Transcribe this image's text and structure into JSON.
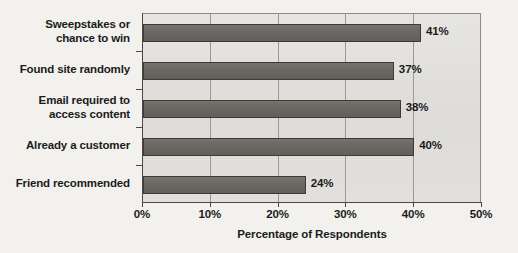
{
  "chart_data": {
    "type": "bar",
    "orientation": "horizontal",
    "title": "",
    "xlabel": "Percentage of Respondents",
    "ylabel": "",
    "xlim": [
      0,
      50
    ],
    "xticks": [
      "0%",
      "10%",
      "20%",
      "30%",
      "40%",
      "50%"
    ],
    "grid": true,
    "legend": false,
    "categories": [
      "Sweepstakes or chance to win",
      "Found site randomly",
      "Email required to access content",
      "Already a customer",
      "Friend recommended"
    ],
    "values": [
      41,
      37,
      38,
      40,
      24
    ],
    "value_labels": [
      "41%",
      "37%",
      "38%",
      "40%",
      "24%"
    ],
    "colors": {
      "bar_fill": "#6a6863",
      "bar_border": "#3b3a37",
      "plot_background": "#e2e0dd",
      "page_background": "#f2f1ee",
      "gridline": "#9c9a96",
      "text": "#1b1b1b"
    }
  },
  "axis": {
    "x_title": "Percentage of Respondents",
    "ticks": [
      {
        "label": "0%",
        "value": 0
      },
      {
        "label": "10%",
        "value": 10
      },
      {
        "label": "20%",
        "value": 20
      },
      {
        "label": "30%",
        "value": 30
      },
      {
        "label": "40%",
        "value": 40
      },
      {
        "label": "50%",
        "value": 50
      }
    ]
  },
  "categories": [
    {
      "line1": "Sweepstakes or",
      "line2": "chance to win",
      "value_label": "41%",
      "value": 41
    },
    {
      "line1": "Found site randomly",
      "line2": "",
      "value_label": "37%",
      "value": 37
    },
    {
      "line1": "Email required to",
      "line2": "access content",
      "value_label": "38%",
      "value": 38
    },
    {
      "line1": "Already a customer",
      "line2": "",
      "value_label": "40%",
      "value": 40
    },
    {
      "line1": "Friend recommended",
      "line2": "",
      "value_label": "24%",
      "value": 24
    }
  ]
}
